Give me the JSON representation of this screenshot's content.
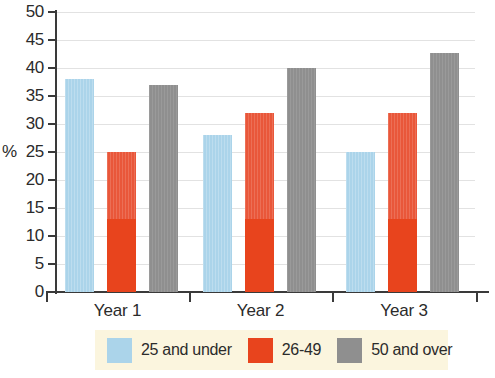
{
  "chart_data": {
    "type": "bar",
    "title": "",
    "xlabel": "",
    "ylabel": "%",
    "ylim": [
      0,
      50
    ],
    "yticks": [
      0,
      5,
      10,
      15,
      20,
      25,
      30,
      35,
      40,
      45,
      50
    ],
    "ytick_labels": [
      "0",
      "5",
      "10",
      "15",
      "20",
      "25",
      "30",
      "35",
      "40",
      "45",
      "50"
    ],
    "grid": true,
    "legend_position": "bottom",
    "categories": [
      "Year 1",
      "Year 2",
      "Year 3"
    ],
    "series": [
      {
        "name": "25 and under",
        "color": "#abd4ea",
        "values": [
          38,
          28,
          25
        ]
      },
      {
        "name": "26-49",
        "color": "#e8441d",
        "values": [
          25,
          32,
          32
        ]
      },
      {
        "name": "50 and over",
        "color": "#8f8f8f",
        "values": [
          37,
          40,
          42.7
        ]
      }
    ]
  },
  "axes": {
    "y_axis_title": "%",
    "y_tick_labels": [
      "50",
      "45",
      "40",
      "35",
      "30",
      "25",
      "20",
      "15",
      "10",
      "5",
      "0"
    ],
    "x_tick_labels": [
      "Year 1",
      "Year 2",
      "Year 3"
    ]
  },
  "legend": {
    "background_color": "#fbf5de",
    "items": [
      {
        "label": "25 and under",
        "color": "#abd4ea",
        "swatch": "legend-swatch-blue"
      },
      {
        "label": "26-49",
        "color": "#e8441d",
        "swatch": "legend-swatch-red"
      },
      {
        "label": "50 and over",
        "color": "#8f8f8f",
        "swatch": "legend-swatch-gray"
      }
    ]
  },
  "title_strip": {
    "text": "clipped chart title"
  }
}
